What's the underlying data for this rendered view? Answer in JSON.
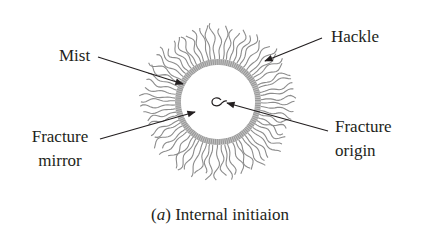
{
  "figure": {
    "caption_prefix": "(",
    "caption_letter": "a",
    "caption_suffix": ") Internal initiaion",
    "labels": {
      "mist": "Mist",
      "hackle": "Hackle",
      "fracture_mirror_line1": "Fracture",
      "fracture_mirror_line2": "mirror",
      "fracture_origin_line1": "Fracture",
      "fracture_origin_line2": "origin"
    },
    "colors": {
      "text": "#231f20",
      "hackle_lines": "#8c8c8c",
      "mist_ring": "#9a9a9a",
      "arrows": "#231f20"
    }
  }
}
